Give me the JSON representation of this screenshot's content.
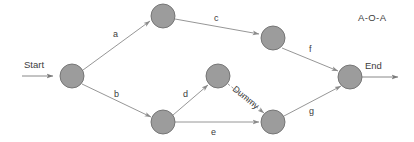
{
  "diagram": {
    "title": "A-O-A",
    "type": "activity-on-arrow-network",
    "background_color": "#ffffff",
    "node_fill_color": "#9c9c9c",
    "node_stroke_color": "#6e6e6e",
    "edge_color": "#8a8a8a",
    "text_color": "#3c3c3c",
    "terminals": {
      "start_label": "Start",
      "end_label": "End"
    },
    "nodes": [
      {
        "id": "n1",
        "name": "start-node",
        "cx": 72,
        "cy": 76,
        "r": 12
      },
      {
        "id": "n2",
        "name": "top-left-node",
        "cx": 163,
        "cy": 16,
        "r": 12
      },
      {
        "id": "n3",
        "name": "top-right-node",
        "cx": 273,
        "cy": 38,
        "r": 12
      },
      {
        "id": "n4",
        "name": "bottom-left-node",
        "cx": 163,
        "cy": 122,
        "r": 12
      },
      {
        "id": "n5",
        "name": "middle-node",
        "cx": 218,
        "cy": 76,
        "r": 12
      },
      {
        "id": "n6",
        "name": "bottom-right-node",
        "cx": 273,
        "cy": 122,
        "r": 12
      },
      {
        "id": "n7",
        "name": "end-node",
        "cx": 350,
        "cy": 77,
        "r": 12
      }
    ],
    "edges": [
      {
        "label": "a",
        "from": "n1",
        "to": "n2",
        "style": "solid",
        "label_x": 116,
        "label_y": 35
      },
      {
        "label": "c",
        "from": "n2",
        "to": "n3",
        "style": "solid",
        "label_x": 217,
        "label_y": 21
      },
      {
        "label": "f",
        "from": "n3",
        "to": "n7",
        "style": "solid",
        "label_x": 311,
        "label_y": 52
      },
      {
        "label": "b",
        "from": "n1",
        "to": "n4",
        "style": "solid",
        "label_x": 117,
        "label_y": 96
      },
      {
        "label": "d",
        "from": "n4",
        "to": "n5",
        "style": "solid",
        "label_x": 186,
        "label_y": 97
      },
      {
        "label": "Dummy",
        "from": "n5",
        "to": "n6",
        "style": "dashed",
        "label_x": 240,
        "label_y": 92
      },
      {
        "label": "e",
        "from": "n4",
        "to": "n6",
        "style": "solid",
        "label_x": 214,
        "label_y": 134
      },
      {
        "label": "g",
        "from": "n6",
        "to": "n7",
        "style": "solid",
        "label_x": 312,
        "label_y": 114
      }
    ]
  }
}
